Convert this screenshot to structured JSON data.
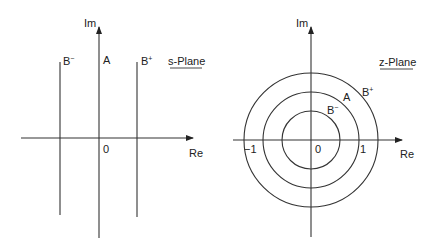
{
  "s_plane": {
    "title": "s-Plane",
    "axis_im": "Im",
    "axis_re": "Re",
    "origin": "0",
    "lines": [
      {
        "name": "B",
        "sup": "−"
      },
      {
        "name": "A",
        "sup": ""
      },
      {
        "name": "B",
        "sup": "+"
      }
    ]
  },
  "z_plane": {
    "title": "z-Plane",
    "axis_im": "Im",
    "axis_re": "Re",
    "origin": "0",
    "tick_neg": "−1",
    "tick_pos": "1",
    "circles": [
      {
        "name": "B",
        "sup": "−"
      },
      {
        "name": "A",
        "sup": ""
      },
      {
        "name": "B",
        "sup": "+"
      }
    ]
  }
}
